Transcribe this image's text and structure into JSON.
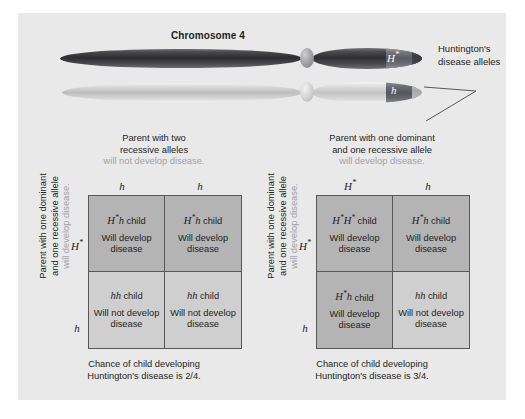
{
  "figure": {
    "chromosome_title": "Chromosome 4",
    "callout_label": "Huntington's disease alleles",
    "allele_dominant": "H",
    "allele_dominant_sup": "*",
    "allele_recessive": "h"
  },
  "squares": [
    {
      "id": "left",
      "top_parent": {
        "line1": "Parent with two",
        "line2": "recessive alleles",
        "muted": "will not develop disease."
      },
      "side_parent": {
        "line1": "Parent with one dominant",
        "line2": "and one recessive allele",
        "muted": "will develop disease."
      },
      "col_heads": [
        {
          "letter": "h",
          "sup": ""
        },
        {
          "letter": "h",
          "sup": ""
        }
      ],
      "row_heads": [
        {
          "letter": "H",
          "sup": "*"
        },
        {
          "letter": "h",
          "sup": ""
        }
      ],
      "cells": [
        {
          "geno_italic": "H",
          "geno_sup": "*",
          "geno_italic2": "h",
          "geno_suffix": " child",
          "outcome": "Will develop disease",
          "state": "affected"
        },
        {
          "geno_italic": "H",
          "geno_sup": "*",
          "geno_italic2": "h",
          "geno_suffix": " child",
          "outcome": "Will develop disease",
          "state": "affected"
        },
        {
          "geno_italic": "hh",
          "geno_sup": "",
          "geno_italic2": "",
          "geno_suffix": " child",
          "outcome": "Will not develop disease",
          "state": "unaffected"
        },
        {
          "geno_italic": "hh",
          "geno_sup": "",
          "geno_italic2": "",
          "geno_suffix": " child",
          "outcome": "Will not develop disease",
          "state": "unaffected"
        }
      ],
      "chance_caption": {
        "line1": "Chance of child developing",
        "line2": "Huntington's disease is 2/4."
      }
    },
    {
      "id": "right",
      "top_parent": {
        "line1": "Parent with one dominant",
        "line2": "and one recessive allele",
        "muted": "will develop disease."
      },
      "side_parent": {
        "line1": "Parent with one dominant",
        "line2": "and one recessive allele",
        "muted": "will develop disease."
      },
      "col_heads": [
        {
          "letter": "H",
          "sup": "*"
        },
        {
          "letter": "h",
          "sup": ""
        }
      ],
      "row_heads": [
        {
          "letter": "H",
          "sup": "*"
        },
        {
          "letter": "h",
          "sup": ""
        }
      ],
      "cells": [
        {
          "geno_italic": "H",
          "geno_sup": "*",
          "geno_italic2": "H",
          "geno_sup2": "*",
          "geno_suffix": " child",
          "outcome": "Will develop disease",
          "state": "affected"
        },
        {
          "geno_italic": "H",
          "geno_sup": "*",
          "geno_italic2": "h",
          "geno_suffix": " child",
          "outcome": "Will develop disease",
          "state": "affected"
        },
        {
          "geno_italic": "H",
          "geno_sup": "*",
          "geno_italic2": "h",
          "geno_suffix": " child",
          "outcome": "Will develop disease",
          "state": "affected"
        },
        {
          "geno_italic": "hh",
          "geno_sup": "",
          "geno_italic2": "",
          "geno_suffix": " child",
          "outcome": "Will not develop disease",
          "state": "unaffected"
        }
      ],
      "chance_caption": {
        "line1": "Chance of child developing",
        "line2": "Huntington's disease is 3/4."
      }
    }
  ],
  "colors": {
    "panel_bg": "#e9e9e9",
    "cell_affected": "#b4b4b4",
    "cell_unaffected": "#cfcfcf",
    "grid_line": "#58585b",
    "text": "#231f20",
    "muted_text": "#a2a2a6"
  }
}
